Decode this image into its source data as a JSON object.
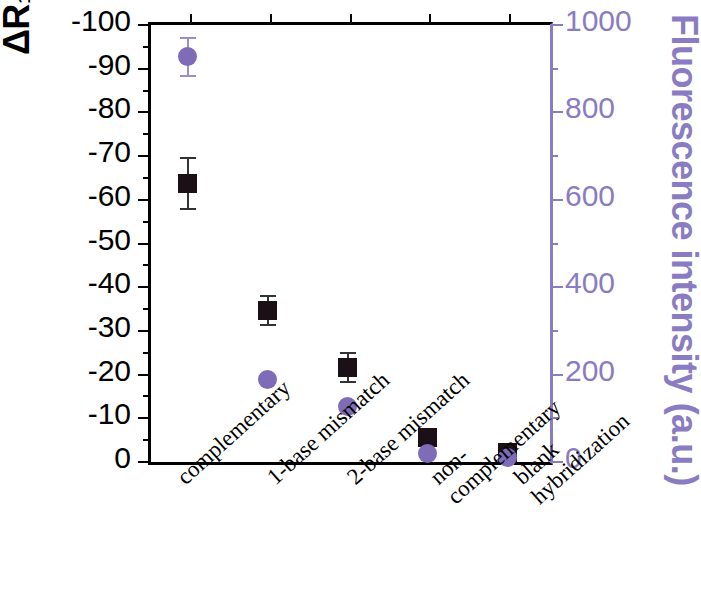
{
  "chart_data": {
    "type": "scatter",
    "title": "",
    "categories": [
      "complementary",
      "1-base mismatch",
      "2-base mismatch",
      "non-complementary",
      "blank hybridization"
    ],
    "category_lines": [
      [
        "complementary"
      ],
      [
        "1-base mismatch"
      ],
      [
        "2-base mismatch"
      ],
      [
        "non-",
        "complementary"
      ],
      [
        "blank",
        "hybridization"
      ]
    ],
    "series": [
      {
        "name": "ΔR1/R1 (%)",
        "marker": "square",
        "color": "#1a1015",
        "axis": "left",
        "values": [
          -63,
          -34,
          -21,
          -5,
          -1.5
        ],
        "errors": [
          6,
          3.5,
          3.5,
          1.5,
          0.8
        ]
      },
      {
        "name": "Fluorescence intensity (a.u.)",
        "marker": "circle",
        "color": "#7e6cb8",
        "axis": "right",
        "values": [
          920,
          182,
          120,
          12,
          3
        ],
        "errors": [
          45,
          10,
          8,
          4,
          2
        ]
      }
    ],
    "xlabel": "",
    "ylabel_left": "ΔR₁/R₁ (%)",
    "ylabel_right": "Fluorescence intensity (a.u.)",
    "ylim_left": [
      0,
      -100
    ],
    "ylim_right": [
      0,
      1000
    ],
    "yticks_left": [
      "-100",
      "-90",
      "-80",
      "-70",
      "-60",
      "-50",
      "-40",
      "-30",
      "-20",
      "-10",
      "0"
    ],
    "yticks_right": [
      "1000",
      "800",
      "600",
      "400",
      "200",
      "0"
    ],
    "grid": false,
    "legend": "none",
    "left_axis_color": "#000000",
    "right_axis_color": "#8a7cc2"
  },
  "axis": {
    "left_title_main": "ΔR",
    "left_title_sub1": "1",
    "left_title_mid": "/R",
    "left_title_sub2": "1",
    "left_title_units": " (%)",
    "right_title": "Fluorescence intensity (a.u.)"
  }
}
